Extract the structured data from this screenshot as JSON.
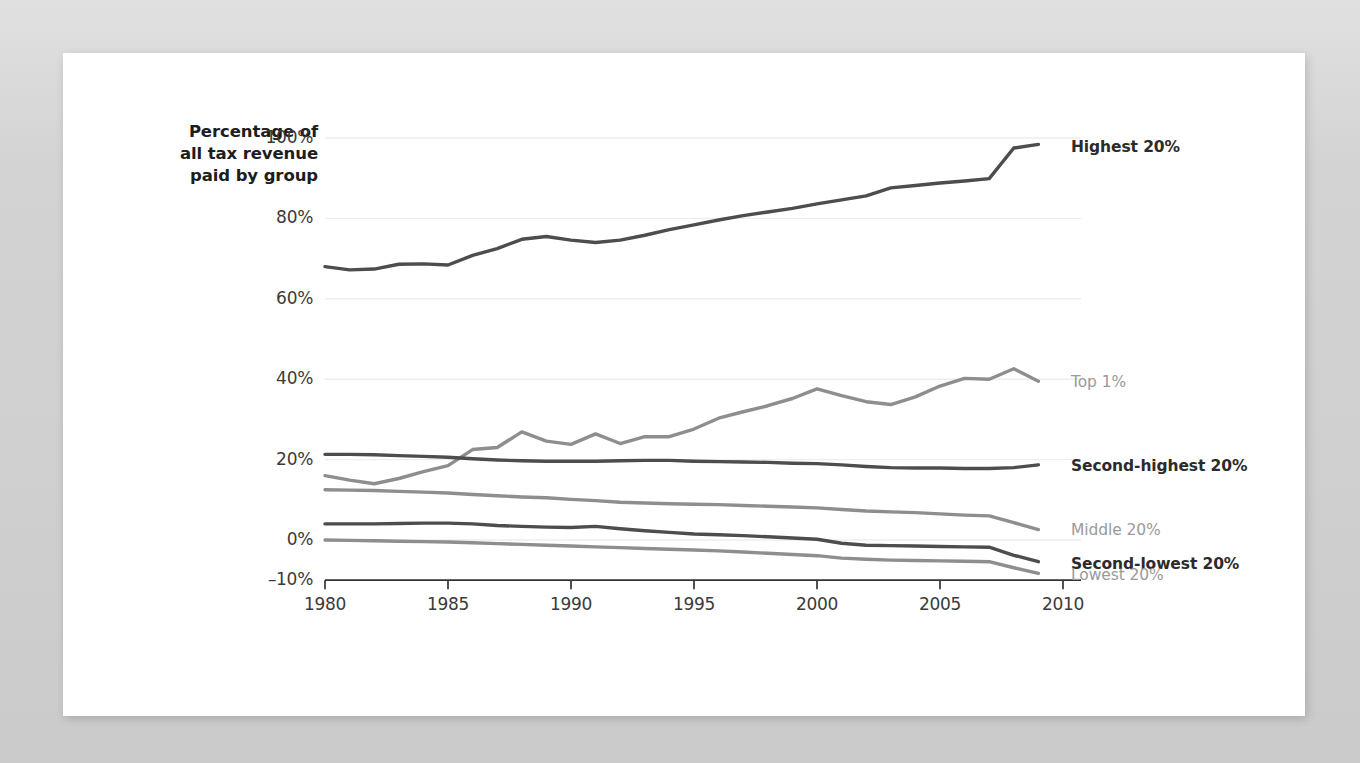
{
  "card": {
    "background_color": "#ffffff",
    "page_background_color": "#d3d3d3"
  },
  "axis_title": {
    "line1": "Percentage of",
    "line2": "all tax revenue",
    "line3": "paid by group",
    "full": "Percentage of all tax revenue paid by group"
  },
  "colors": {
    "dark_line": "#4d4d4d",
    "light_line": "#8e8e8e",
    "grid": "#eeeeee",
    "axis": "#333333",
    "dark_label": "#2b2b2b",
    "light_label": "#9a9a9a"
  },
  "y_ticks": [
    "100%",
    "80%",
    "60%",
    "40%",
    "20%",
    "0%",
    "–10%"
  ],
  "x_ticks": [
    "1980",
    "1985",
    "1990",
    "1995",
    "2000",
    "2005",
    "2010"
  ],
  "series_labels": [
    {
      "name": "highest-20",
      "text": "Highest 20%",
      "style": "dark"
    },
    {
      "name": "top-1",
      "text": "Top 1%",
      "style": "light"
    },
    {
      "name": "second-highest-20",
      "text": "Second-highest 20%",
      "style": "dark"
    },
    {
      "name": "middle-20",
      "text": "Middle 20%",
      "style": "light"
    },
    {
      "name": "second-lowest-20",
      "text": "Second-lowest 20%",
      "style": "dark"
    },
    {
      "name": "lowest-20",
      "text": "Lowest 20%",
      "style": "light"
    }
  ],
  "chart_data": {
    "type": "line",
    "title": "",
    "subtitle": "",
    "xlabel": "",
    "ylabel": "Percentage of all tax revenue paid by group",
    "xlim": [
      1980,
      2010
    ],
    "ylim": [
      -10,
      100
    ],
    "y_tick_values": [
      100,
      80,
      60,
      40,
      20,
      0,
      -10
    ],
    "x_tick_values": [
      1980,
      1985,
      1990,
      1995,
      2000,
      2005,
      2010
    ],
    "grid": "horizontal",
    "legend_position": "right-inline",
    "x": [
      1980,
      1981,
      1982,
      1983,
      1984,
      1985,
      1986,
      1987,
      1988,
      1989,
      1990,
      1991,
      1992,
      1993,
      1994,
      1995,
      1996,
      1997,
      1998,
      1999,
      2000,
      2001,
      2002,
      2003,
      2004,
      2005,
      2006,
      2007,
      2008,
      2009
    ],
    "series": [
      {
        "name": "Highest 20%",
        "color": "#4d4d4d",
        "style": "dark",
        "values": [
          68.0,
          67.2,
          67.4,
          68.6,
          68.7,
          68.4,
          70.8,
          72.5,
          74.8,
          75.5,
          74.6,
          74.0,
          74.6,
          75.8,
          77.2,
          78.4,
          79.6,
          80.7,
          81.6,
          82.5,
          83.6,
          84.6,
          85.6,
          87.6,
          88.2,
          88.8,
          89.3,
          89.9,
          97.5,
          98.4
        ]
      },
      {
        "name": "Top 1%",
        "color": "#8e8e8e",
        "style": "light",
        "values": [
          16.0,
          14.9,
          14.0,
          15.3,
          17.0,
          18.5,
          22.5,
          23.0,
          26.9,
          24.6,
          23.8,
          26.4,
          24.0,
          25.7,
          25.7,
          27.6,
          30.3,
          31.9,
          33.4,
          35.2,
          37.6,
          35.9,
          34.4,
          33.7,
          35.6,
          38.3,
          40.2,
          40.0,
          42.6,
          39.5
        ]
      },
      {
        "name": "Second-highest 20%",
        "color": "#4d4d4d",
        "style": "dark",
        "values": [
          21.3,
          21.3,
          21.2,
          21.0,
          20.8,
          20.6,
          20.2,
          19.9,
          19.7,
          19.6,
          19.6,
          19.6,
          19.7,
          19.8,
          19.8,
          19.6,
          19.5,
          19.4,
          19.3,
          19.1,
          19.0,
          18.7,
          18.3,
          18.0,
          17.9,
          17.9,
          17.8,
          17.8,
          18.0,
          18.7
        ]
      },
      {
        "name": "Middle 20%",
        "color": "#8e8e8e",
        "style": "light",
        "values": [
          12.5,
          12.4,
          12.3,
          12.1,
          11.9,
          11.7,
          11.3,
          11.0,
          10.7,
          10.5,
          10.1,
          9.8,
          9.4,
          9.2,
          9.0,
          8.9,
          8.8,
          8.6,
          8.4,
          8.2,
          8.0,
          7.6,
          7.2,
          7.0,
          6.8,
          6.5,
          6.2,
          6.0,
          4.3,
          2.6
        ]
      },
      {
        "name": "Second-lowest 20%",
        "color": "#4d4d4d",
        "style": "dark",
        "values": [
          4.0,
          4.0,
          4.0,
          4.1,
          4.2,
          4.2,
          4.0,
          3.6,
          3.4,
          3.2,
          3.1,
          3.4,
          2.8,
          2.3,
          1.9,
          1.5,
          1.3,
          1.1,
          0.8,
          0.5,
          0.2,
          -0.8,
          -1.3,
          -1.4,
          -1.5,
          -1.6,
          -1.7,
          -1.8,
          -3.8,
          -5.4
        ]
      },
      {
        "name": "Lowest 20%",
        "color": "#8e8e8e",
        "style": "light",
        "values": [
          0.0,
          -0.1,
          -0.2,
          -0.3,
          -0.4,
          -0.5,
          -0.7,
          -0.9,
          -1.1,
          -1.3,
          -1.5,
          -1.7,
          -1.9,
          -2.1,
          -2.3,
          -2.5,
          -2.7,
          -3.0,
          -3.3,
          -3.6,
          -3.9,
          -4.5,
          -4.8,
          -5.0,
          -5.1,
          -5.2,
          -5.3,
          -5.4,
          -6.9,
          -8.3
        ]
      }
    ]
  }
}
